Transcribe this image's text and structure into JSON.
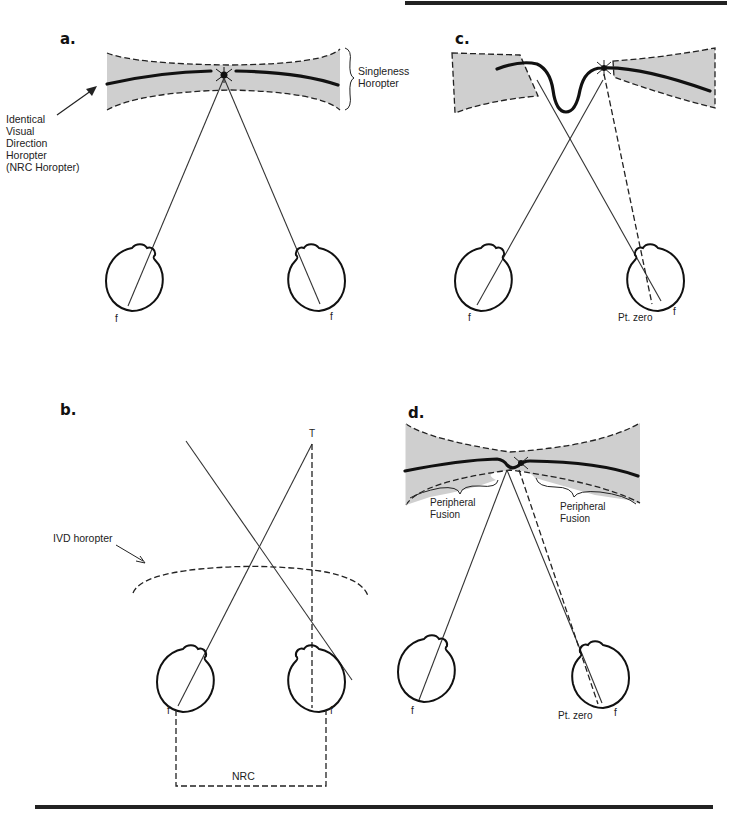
{
  "figure": {
    "panels": [
      {
        "id": "a",
        "letter": "a.",
        "labels": {
          "ivd_horopter": [
            "Identical",
            "Visual",
            "Direction",
            "Horopter",
            "(NRC Horopter)"
          ],
          "singleness_horopter": [
            "Singleness",
            "Horopter"
          ],
          "left_fovea": "f",
          "right_fovea": "f"
        }
      },
      {
        "id": "b",
        "letter": "b.",
        "labels": {
          "target": "T",
          "ivd_horopter": "IVD horopter",
          "left_fovea": "f",
          "right_fovea": "f",
          "nrc": "NRC"
        }
      },
      {
        "id": "c",
        "letter": "c.",
        "labels": {
          "left_fovea": "f",
          "point_zero": "Pt. zero",
          "right_fovea": "f"
        }
      },
      {
        "id": "d",
        "letter": "d.",
        "labels": {
          "peripheral_fusion_left": [
            "Peripheral",
            "Fusion"
          ],
          "peripheral_fusion_right": [
            "Peripheral",
            "Fusion"
          ],
          "left_fovea": "f",
          "point_zero": "Pt. zero",
          "right_fovea": "f"
        }
      }
    ],
    "colors": {
      "band_fill": "#cfcfcf",
      "ink": "#111111"
    }
  }
}
